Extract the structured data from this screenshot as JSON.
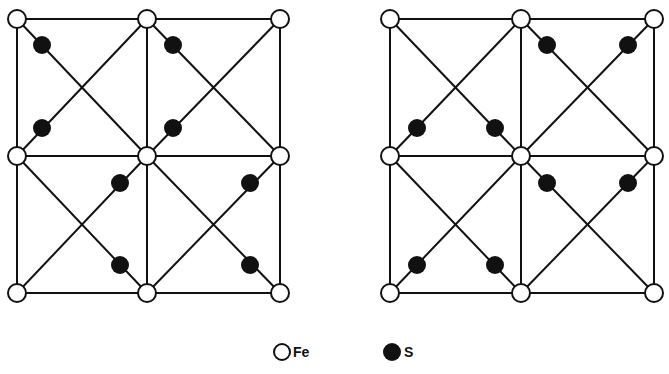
{
  "diagrams": [
    {
      "id": "left",
      "fe": [
        [
          17,
          19
        ],
        [
          147,
          19
        ],
        [
          280,
          19
        ],
        [
          17,
          156
        ],
        [
          147,
          156
        ],
        [
          280,
          156
        ],
        [
          17,
          293
        ],
        [
          147,
          293
        ],
        [
          280,
          293
        ]
      ],
      "edges": [
        [
          17,
          19,
          280,
          19
        ],
        [
          17,
          156,
          280,
          156
        ],
        [
          17,
          293,
          280,
          293
        ],
        [
          17,
          19,
          17,
          293
        ],
        [
          147,
          19,
          147,
          293
        ],
        [
          280,
          19,
          280,
          293
        ],
        [
          17,
          19,
          147,
          156
        ],
        [
          147,
          19,
          17,
          156
        ],
        [
          147,
          19,
          280,
          156
        ],
        [
          280,
          19,
          147,
          156
        ],
        [
          17,
          156,
          147,
          293
        ],
        [
          147,
          156,
          17,
          293
        ],
        [
          147,
          156,
          280,
          293
        ],
        [
          280,
          156,
          147,
          293
        ]
      ],
      "s": [
        [
          42,
          45
        ],
        [
          173,
          45
        ],
        [
          42,
          128
        ],
        [
          173,
          128
        ],
        [
          120,
          183
        ],
        [
          250,
          183
        ],
        [
          120,
          265
        ],
        [
          250,
          265
        ]
      ]
    },
    {
      "id": "right",
      "fe": [
        [
          390,
          19
        ],
        [
          521,
          19
        ],
        [
          654,
          19
        ],
        [
          390,
          156
        ],
        [
          521,
          156
        ],
        [
          654,
          156
        ],
        [
          390,
          293
        ],
        [
          521,
          293
        ],
        [
          654,
          293
        ]
      ],
      "edges": [
        [
          390,
          19,
          654,
          19
        ],
        [
          390,
          156,
          654,
          156
        ],
        [
          390,
          293,
          654,
          293
        ],
        [
          390,
          19,
          390,
          293
        ],
        [
          521,
          19,
          521,
          293
        ],
        [
          654,
          19,
          654,
          293
        ],
        [
          390,
          19,
          521,
          156
        ],
        [
          521,
          19,
          390,
          156
        ],
        [
          521,
          19,
          654,
          156
        ],
        [
          654,
          19,
          521,
          156
        ],
        [
          390,
          156,
          521,
          293
        ],
        [
          521,
          156,
          390,
          293
        ],
        [
          521,
          156,
          654,
          293
        ],
        [
          654,
          156,
          521,
          293
        ]
      ],
      "s": [
        [
          547,
          45
        ],
        [
          628,
          45
        ],
        [
          417,
          128
        ],
        [
          495,
          128
        ],
        [
          547,
          183
        ],
        [
          628,
          183
        ],
        [
          417,
          265
        ],
        [
          495,
          265
        ]
      ]
    }
  ],
  "legend": {
    "fe": {
      "label": "Fe",
      "symbol": "open-circle",
      "x": 282,
      "y": 352
    },
    "s": {
      "label": "S",
      "symbol": "filled-circle",
      "x": 392,
      "y": 352
    }
  },
  "style": {
    "line_color": "#111111",
    "fe_fill": "#ffffff",
    "s_fill": "#111111",
    "fe_radius": 9,
    "s_radius": 9
  }
}
